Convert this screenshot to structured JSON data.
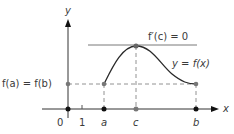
{
  "diagram": {
    "y_axis_label": "y",
    "x_axis_label": "x",
    "origin_label": "0",
    "tick_one_label": "1",
    "points": {
      "a": "a",
      "c": "c",
      "b": "b"
    },
    "tangent_label": "f′(c) = 0",
    "curve_label": "y = f(x)",
    "level_label": "f(a) = f(b)",
    "colors": {
      "axis": "#333333",
      "curve": "#2a2a2a",
      "guides": "#777777",
      "point_gray": "#777777",
      "point_black": "#111111"
    }
  }
}
